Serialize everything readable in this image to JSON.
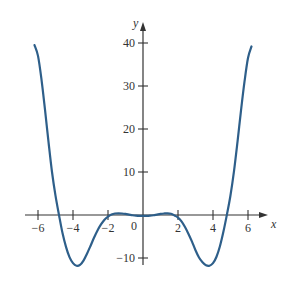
{
  "chart_data": {
    "type": "line",
    "title": "",
    "xlabel": "x",
    "ylabel": "y",
    "xlim": [
      -6.5,
      7.0
    ],
    "ylim": [
      -12,
      43
    ],
    "grid": false,
    "legend": null,
    "x_ticks": [
      -6,
      -4,
      -2,
      2,
      4,
      6
    ],
    "x_tick_labels": [
      "−6",
      "−4",
      "−2",
      "2",
      "4",
      "6"
    ],
    "y_ticks": [
      40,
      30,
      20,
      10,
      -10
    ],
    "y_tick_labels": [
      "40",
      "30",
      "20",
      "10",
      "−10"
    ],
    "origin_label": "0",
    "series": [
      {
        "name": "f(x)",
        "color": "#2e5f8a",
        "x": [
          -6.2,
          -6.0,
          -5.8,
          -5.6,
          -5.4,
          -5.2,
          -5.0,
          -4.8,
          -4.6,
          -4.4,
          -4.2,
          -4.0,
          -3.8,
          -3.6,
          -3.4,
          -3.2,
          -3.0,
          -2.8,
          -2.6,
          -2.4,
          -2.2,
          -2.0,
          -1.8,
          -1.6,
          -1.4,
          -1.2,
          -1.0,
          -0.8,
          -0.6,
          -0.4,
          -0.2,
          0.0,
          0.2,
          0.4,
          0.6,
          0.8,
          1.0,
          1.2,
          1.4,
          1.6,
          1.8,
          2.0,
          2.2,
          2.4,
          2.6,
          2.8,
          3.0,
          3.2,
          3.4,
          3.6,
          3.8,
          4.0,
          4.2,
          4.4,
          4.6,
          4.8,
          5.0,
          5.2,
          5.4,
          5.6,
          5.8,
          6.0,
          6.2
        ],
        "y": [
          39.5,
          37.0,
          31.5,
          24.5,
          17.0,
          10.0,
          4.5,
          0.0,
          -4.2,
          -7.4,
          -9.8,
          -11.2,
          -11.8,
          -11.6,
          -10.6,
          -9.0,
          -7.2,
          -5.3,
          -3.6,
          -2.2,
          -1.1,
          -0.4,
          0.1,
          0.35,
          0.4,
          0.35,
          0.25,
          0.1,
          -0.05,
          -0.15,
          -0.2,
          -0.2,
          -0.2,
          -0.15,
          -0.05,
          0.1,
          0.25,
          0.35,
          0.4,
          0.3,
          -0.1,
          -0.6,
          -1.5,
          -2.8,
          -4.4,
          -6.2,
          -8.2,
          -9.9,
          -11.0,
          -11.7,
          -11.8,
          -11.2,
          -9.7,
          -7.2,
          -3.8,
          0.2,
          4.6,
          10.2,
          17.0,
          24.3,
          31.0,
          36.5,
          39.2
        ]
      }
    ]
  }
}
